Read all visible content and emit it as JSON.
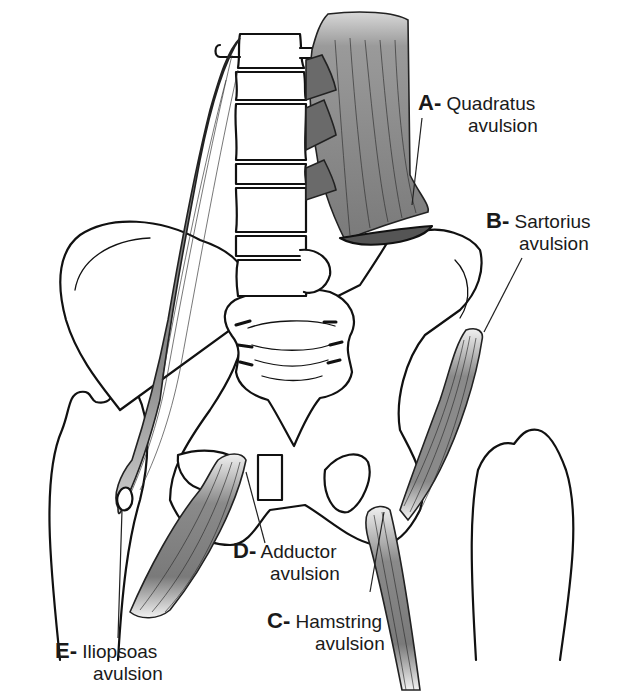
{
  "figure": {
    "colors": {
      "background": "#ffffff",
      "line": "#111111",
      "muscle_dark": "#6e6e6e",
      "muscle_light": "#e6e6e6"
    }
  },
  "labels": [
    {
      "id": "A",
      "letter": "A-",
      "name": "Quadratus",
      "line2": "avulsion"
    },
    {
      "id": "B",
      "letter": "B-",
      "name": "Sartorius",
      "line2": "avulsion"
    },
    {
      "id": "C",
      "letter": "C-",
      "name": "Hamstring",
      "line2": "avulsion"
    },
    {
      "id": "D",
      "letter": "D-",
      "name": "Adductor",
      "line2": "avulsion"
    },
    {
      "id": "E",
      "letter": "E-",
      "name": "Iliopsoas",
      "line2": "avulsion"
    }
  ]
}
